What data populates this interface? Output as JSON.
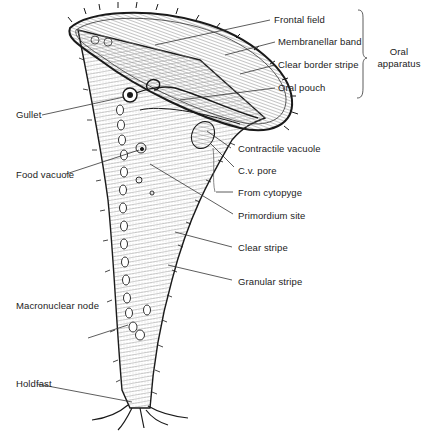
{
  "diagram": {
    "labels": {
      "frontal_field": "Frontal field",
      "membranellar_band": "Membranellar band",
      "clear_border_stripe": "Clear border stripe",
      "oral_pouch": "Oral pouch",
      "oral_apparatus_line1": "Oral",
      "oral_apparatus_line2": "apparatus",
      "gullet": "Gullet",
      "contractile_vacuole": "Contractile vacuole",
      "cv_pore": "C.v. pore",
      "food_vacuole": "Food vacuole",
      "from_cytopyge": "From cytopyge",
      "primordium_site": "Primordium site",
      "clear_stripe": "Clear stripe",
      "granular_stripe": "Granular stripe",
      "macronuclear_node": "Macronuclear node",
      "holdfast": "Holdfast"
    },
    "groups": [
      {
        "name": "Oral apparatus",
        "members": [
          "Frontal field",
          "Membranellar band",
          "Clear border stripe",
          "Oral pouch"
        ]
      }
    ],
    "colors": {
      "ink": "#1a1a1a",
      "background": "#ffffff",
      "text": "#222222"
    }
  }
}
